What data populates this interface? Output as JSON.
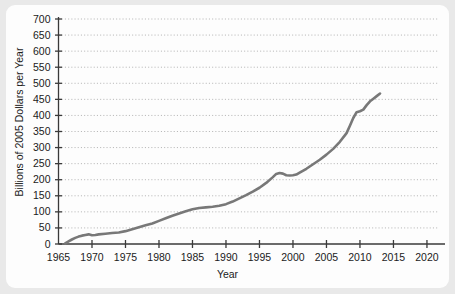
{
  "chart_data": {
    "type": "line",
    "title": "",
    "xlabel": "Year",
    "ylabel": "Billions of 2005 Dollars per Year",
    "xlim": [
      1965,
      2021.5
    ],
    "ylim": [
      0,
      700
    ],
    "grid": true,
    "grid_style": "dotted-horizontal",
    "legend": "none",
    "line_color": "#787878",
    "axis_color": "#3a3a3a",
    "grid_color": "#b9b9b9",
    "background": "#fdfdfd",
    "page_background": "#e9e9e9",
    "xticks": [
      1965,
      1970,
      1975,
      1980,
      1985,
      1990,
      1995,
      2000,
      2005,
      2010,
      2015,
      2020
    ],
    "xtick_labels": [
      "1965",
      "1970",
      "1975",
      "1980",
      "1985",
      "1990",
      "1995",
      "2000",
      "2005",
      "2010",
      "2015",
      "2020"
    ],
    "yticks": [
      0,
      50,
      100,
      150,
      200,
      250,
      300,
      350,
      400,
      450,
      500,
      550,
      600,
      650,
      700
    ],
    "ytick_labels": [
      "0",
      "50",
      "100",
      "150",
      "200",
      "250",
      "300",
      "350",
      "400",
      "450",
      "500",
      "550",
      "600",
      "650",
      "700"
    ],
    "series": [
      {
        "name": "Spending",
        "x": [
          1966.0,
          1966.5,
          1967.0,
          1967.5,
          1968.0,
          1968.5,
          1969.0,
          1969.5,
          1970.0,
          1970.5,
          1971.0,
          1972.0,
          1973.0,
          1974.0,
          1975.0,
          1976.0,
          1977.0,
          1978.0,
          1979.0,
          1980.0,
          1981.0,
          1982.0,
          1983.0,
          1984.0,
          1985.0,
          1986.0,
          1987.0,
          1988.0,
          1989.0,
          1990.0,
          1991.0,
          1992.0,
          1993.0,
          1994.0,
          1995.0,
          1996.0,
          1997.0,
          1997.5,
          1998.0,
          1998.5,
          1999.0,
          1999.5,
          2000.0,
          2000.5,
          2001.0,
          2002.0,
          2003.0,
          2004.0,
          2005.0,
          2006.0,
          2007.0,
          2008.0,
          2008.5,
          2009.0,
          2009.5,
          2010.0,
          2010.5,
          2011.0,
          2011.5,
          2012.0,
          2012.5,
          2013.0
        ],
        "y": [
          2,
          8,
          14,
          19,
          23,
          26,
          28,
          30,
          27,
          28,
          30,
          32,
          34,
          36,
          40,
          46,
          52,
          58,
          64,
          72,
          80,
          88,
          95,
          102,
          108,
          112,
          114,
          116,
          119,
          124,
          132,
          142,
          152,
          163,
          175,
          190,
          208,
          218,
          221,
          219,
          214,
          213,
          214,
          216,
          222,
          234,
          248,
          262,
          278,
          296,
          318,
          345,
          368,
          392,
          410,
          413,
          418,
          432,
          444,
          452,
          460,
          468
        ]
      }
    ],
    "annotations": []
  },
  "axis": {
    "x_title": "Year",
    "y_title": "Billions of 2005 Dollars per Year"
  }
}
